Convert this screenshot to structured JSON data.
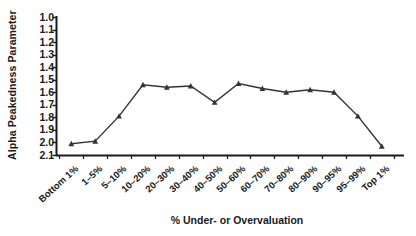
{
  "chart_data": {
    "type": "line",
    "title": "",
    "xlabel": "% Under- or Overvaluation",
    "ylabel": "Alpha Peakedness Parameter",
    "categories": [
      "Bottom 1%",
      "1–5%",
      "5–10%",
      "10–20%",
      "20–30%",
      "30–40%",
      "40–50%",
      "50–60%",
      "60–70%",
      "70–80%",
      "80–90%",
      "90–95%",
      "95–99%",
      "Top 1%"
    ],
    "values": [
      2.01,
      1.99,
      1.79,
      1.54,
      1.56,
      1.55,
      1.68,
      1.53,
      1.57,
      1.6,
      1.58,
      1.6,
      1.79,
      2.03
    ],
    "ylim": [
      1.0,
      2.1
    ],
    "y_inverted": true,
    "yticks": [
      "1.0",
      "1.1",
      "1.2",
      "1.3",
      "1.4",
      "1.5",
      "1.6",
      "1.7",
      "1.8",
      "1.9",
      "2.0",
      "2.1"
    ],
    "grid": false,
    "legend": false,
    "series_color": "#333333",
    "marker": "triangle"
  }
}
